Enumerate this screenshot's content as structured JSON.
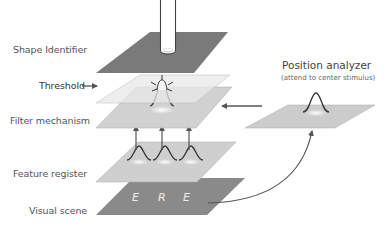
{
  "labels": {
    "shape_identifier": "Shape Identifier",
    "threshold": "Threshold",
    "filter_mechanism": "Filter mechanism",
    "feature_register": "Feature register",
    "visual_scene": "Visual scene"
  },
  "position_analyzer": {
    "title": "Position analyzer",
    "subtitle": "(attend to center stimulus)"
  },
  "visual_scene_letters": [
    "E",
    "R",
    "E"
  ],
  "colors": {
    "shape_identifier_plane": "#7a7a7a",
    "threshold_plane": "#e6e6e6",
    "filter_plane": "#cfcfcf",
    "feature_plane": "#cfcfcf",
    "scene_plane": "#8a8a8a",
    "position_plane": "#cccccc",
    "arrow": "#555555"
  }
}
